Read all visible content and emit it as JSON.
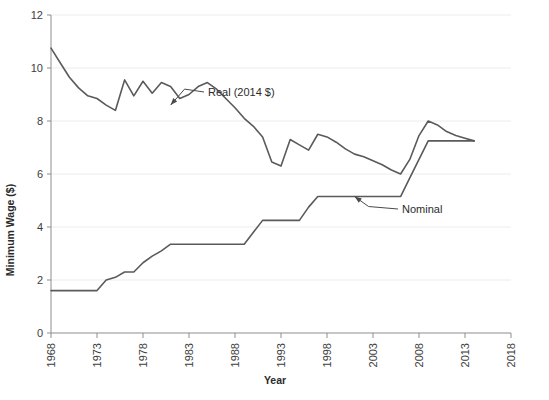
{
  "chart_data": {
    "type": "line",
    "title": "",
    "xlabel": "Year",
    "ylabel": "Minimum Wage ($)",
    "xlim": [
      1968,
      2018
    ],
    "ylim": [
      0,
      12
    ],
    "grid": true,
    "legend_position": "inline-annotations",
    "x_ticks": [
      "1968",
      "1973",
      "1978",
      "1983",
      "1988",
      "1993",
      "1998",
      "2003",
      "2008",
      "2013",
      "2018"
    ],
    "y_ticks": [
      "0",
      "2",
      "4",
      "6",
      "8",
      "10",
      "12"
    ],
    "x": [
      1968,
      1969,
      1970,
      1971,
      1972,
      1973,
      1974,
      1975,
      1976,
      1977,
      1978,
      1979,
      1980,
      1981,
      1982,
      1983,
      1984,
      1985,
      1986,
      1987,
      1988,
      1989,
      1990,
      1991,
      1992,
      1993,
      1994,
      1995,
      1996,
      1997,
      1998,
      1999,
      2000,
      2001,
      2002,
      2003,
      2004,
      2005,
      2006,
      2007,
      2008,
      2009,
      2010,
      2011,
      2012,
      2013,
      2014
    ],
    "series": [
      {
        "name": "Real (2014 $)",
        "annotation": "Real (2014 $)",
        "values": [
          10.75,
          10.2,
          9.65,
          9.25,
          8.95,
          8.85,
          8.6,
          8.4,
          9.55,
          8.95,
          9.5,
          9.05,
          9.45,
          9.3,
          8.85,
          9.0,
          9.3,
          9.45,
          9.2,
          8.85,
          8.5,
          8.1,
          7.8,
          7.4,
          6.45,
          6.3,
          7.3,
          7.1,
          6.9,
          7.5,
          7.4,
          7.2,
          6.95,
          6.75,
          6.65,
          6.5,
          6.35,
          6.15,
          6.0,
          6.55,
          7.45,
          8.0,
          7.85,
          7.6,
          7.45,
          7.35,
          7.25
        ]
      },
      {
        "name": "Nominal",
        "annotation": "Nominal",
        "values": [
          1.6,
          1.6,
          1.6,
          1.6,
          1.6,
          1.6,
          2.0,
          2.1,
          2.3,
          2.3,
          2.65,
          2.9,
          3.1,
          3.35,
          3.35,
          3.35,
          3.35,
          3.35,
          3.35,
          3.35,
          3.35,
          3.35,
          3.8,
          4.25,
          4.25,
          4.25,
          4.25,
          4.25,
          4.75,
          5.15,
          5.15,
          5.15,
          5.15,
          5.15,
          5.15,
          5.15,
          5.15,
          5.15,
          5.15,
          5.85,
          6.55,
          7.25,
          7.25,
          7.25,
          7.25,
          7.25,
          7.25
        ]
      }
    ]
  },
  "annotations": {
    "real": {
      "label": "Real (2014 $)",
      "point_year": 1981,
      "point_value": 8.6
    },
    "nominal": {
      "label": "Nominal",
      "point_year": 2001,
      "point_value": 5.15
    }
  },
  "caption": {
    "text": ""
  },
  "colors": {
    "line": "#5a5a5a",
    "axis": "#8d8d8d",
    "grid": "#ececec",
    "text": "#2b2b2b",
    "background": "#ffffff"
  }
}
